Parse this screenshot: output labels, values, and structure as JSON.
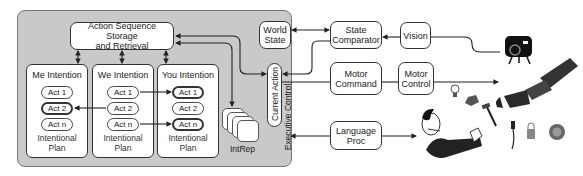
{
  "executive_control": {
    "label": "Executive Control",
    "storage": "Action Sequence Storage and Retrieval",
    "storage_line1": "Action Sequence Storage",
    "storage_line2": "and Retrieval",
    "intentions": [
      {
        "title": "Me Intention",
        "acts": [
          "Act 1",
          "Act 2",
          "Act n"
        ],
        "highlighted": [
          1
        ],
        "plan_line1": "Intentional",
        "plan_line2": "Plan"
      },
      {
        "title": "We Intention",
        "acts": [
          "Act 1",
          "Act 2",
          "Act n"
        ],
        "highlighted": [],
        "plan_line1": "Intentional",
        "plan_line2": "Plan"
      },
      {
        "title": "You Intention",
        "acts": [
          "Act 1",
          "Act 2",
          "Act n"
        ],
        "highlighted": [
          0,
          2
        ],
        "plan_line1": "Intentional",
        "plan_line2": "Plan"
      }
    ],
    "intrep": "IntRep",
    "current_action": "Current Action",
    "world_state_line1": "World",
    "world_state_line2": "State"
  },
  "external": {
    "state_comparator_line1": "State",
    "state_comparator_line2": "Comparator",
    "vision": "Vision",
    "motor_command_line1": "Motor",
    "motor_command_line2": "Command",
    "motor_control_line1": "Motor",
    "motor_control_line2": "Control",
    "language_proc_line1": "Language",
    "language_proc_line2": "Proc"
  },
  "illustrations": [
    "camera-icon",
    "robot-arm-icon",
    "human-with-headset-icon",
    "light-bulb-icon",
    "turtle-toy-icon",
    "hammer-icon",
    "cable-plug-icon",
    "padlock-icon",
    "lion-toy-icon"
  ],
  "colors": {
    "panel": "#c9c9c9",
    "border": "#333333",
    "box": "#ffffff"
  }
}
